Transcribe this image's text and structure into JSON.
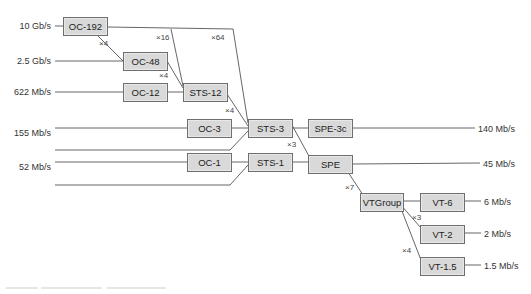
{
  "diagram": {
    "nodes": [
      {
        "id": "oc192",
        "label": "OC-192",
        "x": 63,
        "y": 17,
        "w": 45,
        "h": 19
      },
      {
        "id": "oc48",
        "label": "OC-48",
        "x": 123,
        "y": 52,
        "w": 45,
        "h": 19
      },
      {
        "id": "oc12",
        "label": "OC-12",
        "x": 123,
        "y": 83,
        "w": 45,
        "h": 19
      },
      {
        "id": "sts12",
        "label": "STS-12",
        "x": 183,
        "y": 83,
        "w": 45,
        "h": 19
      },
      {
        "id": "oc3",
        "label": "OC-3",
        "x": 187,
        "y": 119,
        "w": 45,
        "h": 19
      },
      {
        "id": "sts3",
        "label": "STS-3",
        "x": 248,
        "y": 119,
        "w": 45,
        "h": 19
      },
      {
        "id": "spe3c",
        "label": "SPE-3c",
        "x": 308,
        "y": 119,
        "w": 45,
        "h": 19
      },
      {
        "id": "oc1",
        "label": "OC-1",
        "x": 187,
        "y": 153,
        "w": 45,
        "h": 19
      },
      {
        "id": "sts1",
        "label": "STS-1",
        "x": 248,
        "y": 153,
        "w": 45,
        "h": 19
      },
      {
        "id": "spe",
        "label": "SPE",
        "x": 308,
        "y": 155,
        "w": 45,
        "h": 19
      },
      {
        "id": "vtgroup",
        "label": "VTGroup",
        "x": 360,
        "y": 193,
        "w": 44,
        "h": 19
      },
      {
        "id": "vt6",
        "label": "VT-6",
        "x": 420,
        "y": 193,
        "w": 45,
        "h": 19
      },
      {
        "id": "vt2",
        "label": "VT-2",
        "x": 420,
        "y": 225,
        "w": 45,
        "h": 19
      },
      {
        "id": "vt15",
        "label": "VT-1.5",
        "x": 420,
        "y": 257,
        "w": 45,
        "h": 19
      }
    ],
    "left_rates": [
      {
        "label": "10 Gb/s",
        "y": 21
      },
      {
        "label": "2.5 Gb/s",
        "y": 56
      },
      {
        "label": "622 Mb/s",
        "y": 87
      },
      {
        "label": "155 Mb/s",
        "y": 128
      },
      {
        "label": "52 Mb/s",
        "y": 162
      }
    ],
    "right_rates": [
      {
        "label": "140 Mb/s",
        "x": 478,
        "y": 124
      },
      {
        "label": "45 Mb/s",
        "x": 483,
        "y": 159
      },
      {
        "label": "6 Mb/s",
        "x": 484,
        "y": 197
      },
      {
        "label": "2 Mb/s",
        "x": 484,
        "y": 229
      },
      {
        "label": "1.5 Mb/s",
        "x": 484,
        "y": 261
      }
    ],
    "multipliers": [
      {
        "label": "×4",
        "x": 99,
        "y": 39
      },
      {
        "label": "×16",
        "x": 156,
        "y": 33
      },
      {
        "label": "×64",
        "x": 211,
        "y": 33
      },
      {
        "label": "×4",
        "x": 159,
        "y": 71
      },
      {
        "label": "×4",
        "x": 225,
        "y": 106
      },
      {
        "label": "×3",
        "x": 287,
        "y": 140
      },
      {
        "label": "×7",
        "x": 345,
        "y": 183
      },
      {
        "label": "×3",
        "x": 412,
        "y": 213
      },
      {
        "label": "×4",
        "x": 402,
        "y": 246
      }
    ],
    "edges": [
      [
        [
          55,
          26
        ],
        [
          63,
          26
        ]
      ],
      [
        [
          108,
          27
        ],
        [
          233,
          29
        ],
        [
          248,
          123
        ]
      ],
      [
        [
          171,
          29
        ],
        [
          183,
          86
        ]
      ],
      [
        [
          98,
          36
        ],
        [
          123,
          61
        ]
      ],
      [
        [
          55,
          61
        ],
        [
          123,
          61
        ]
      ],
      [
        [
          167,
          61
        ],
        [
          183,
          88
        ]
      ],
      [
        [
          55,
          92
        ],
        [
          123,
          92
        ]
      ],
      [
        [
          167,
          92
        ],
        [
          183,
          92
        ]
      ],
      [
        [
          227,
          94
        ],
        [
          248,
          126
        ]
      ],
      [
        [
          55,
          128
        ],
        [
          187,
          128
        ]
      ],
      [
        [
          231,
          128
        ],
        [
          248,
          128
        ]
      ],
      [
        [
          55,
          150
        ],
        [
          230,
          150
        ],
        [
          248,
          131
        ]
      ],
      [
        [
          55,
          162
        ],
        [
          187,
          162
        ]
      ],
      [
        [
          231,
          162
        ],
        [
          248,
          162
        ]
      ],
      [
        [
          55,
          185
        ],
        [
          230,
          185
        ],
        [
          248,
          165
        ]
      ],
      [
        [
          292,
          128
        ],
        [
          308,
          128
        ]
      ],
      [
        [
          292,
          125
        ],
        [
          310,
          158
        ]
      ],
      [
        [
          352,
          128
        ],
        [
          475,
          128
        ]
      ],
      [
        [
          292,
          162
        ],
        [
          308,
          162
        ]
      ],
      [
        [
          352,
          164
        ],
        [
          480,
          163
        ]
      ],
      [
        [
          348,
          172
        ],
        [
          363,
          195
        ]
      ],
      [
        [
          403,
          201
        ],
        [
          420,
          201
        ]
      ],
      [
        [
          400,
          204
        ],
        [
          421,
          228
        ]
      ],
      [
        [
          400,
          206
        ],
        [
          421,
          260
        ]
      ],
      [
        [
          464,
          201
        ],
        [
          481,
          201
        ]
      ],
      [
        [
          464,
          233
        ],
        [
          481,
          233
        ]
      ],
      [
        [
          464,
          265
        ],
        [
          481,
          265
        ]
      ]
    ]
  }
}
